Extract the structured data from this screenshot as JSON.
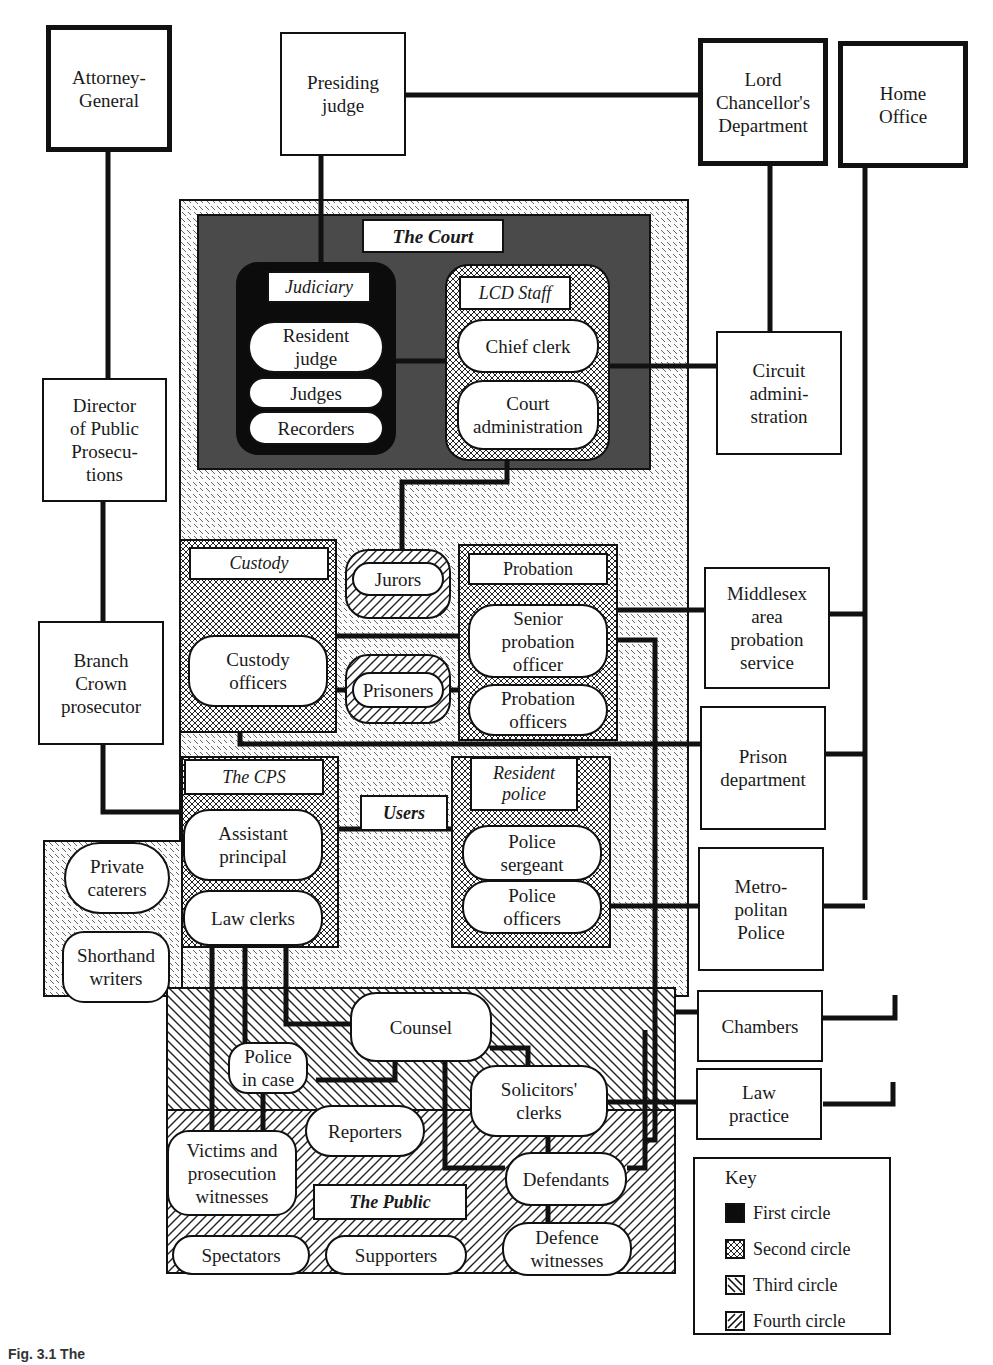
{
  "external": {
    "attorney_general": "Attorney-\nGeneral",
    "presiding_judge": "Presiding\njudge",
    "lcd": "Lord\nChancellor's\nDepartment",
    "home_office": "Home\nOffice",
    "dpp": "Director\nof Public\nProsecu-\ntions",
    "branch_crown": "Branch\nCrown\nprosecutor",
    "circuit_admin": "Circuit\nadmini-\nstration",
    "middlesex": "Middlesex\narea\nprobation\nservice",
    "prison_dept": "Prison\ndepartment",
    "met_police": "Metro-\npolitan\nPolice",
    "chambers": "Chambers",
    "law_practice": "Law\npractice"
  },
  "court": {
    "title": "The Court",
    "judiciary": {
      "title": "Judiciary",
      "members": [
        "Resident\njudge",
        "Judges",
        "Recorders"
      ]
    },
    "lcd_staff": {
      "title": "LCD Staff",
      "members": [
        "Chief clerk",
        "Court\nadministration"
      ]
    }
  },
  "users": {
    "title": "Users",
    "custody": {
      "title": "Custody",
      "members": [
        "Custody\nofficers"
      ]
    },
    "jurors": "Jurors",
    "prisoners": "Prisoners",
    "probation": {
      "title": "Probation",
      "members": [
        "Senior\nprobation\nofficer",
        "Probation\nofficers"
      ]
    },
    "cps": {
      "title": "The CPS",
      "members": [
        "Assistant\nprincipal",
        "Law clerks"
      ]
    },
    "resident_police": {
      "title": "Resident\npolice",
      "members": [
        "Police\nsergeant",
        "Police\nofficers"
      ]
    },
    "side": [
      "Private\ncaterers",
      "Shorthand\nwriters"
    ]
  },
  "third_circle": [
    "Counsel",
    "Police\nin case",
    "Solicitors'\nclerks"
  ],
  "public": {
    "title": "The Public",
    "members": [
      "Reporters",
      "Victims and\nprosecution\nwitnesses",
      "Defendants",
      "Spectators",
      "Supporters",
      "Defence\nwitnesses"
    ]
  },
  "key": {
    "title": "Key",
    "items": [
      "First circle",
      "Second circle",
      "Third circle",
      "Fourth circle"
    ]
  },
  "caption": "Fig. 3.1 The"
}
